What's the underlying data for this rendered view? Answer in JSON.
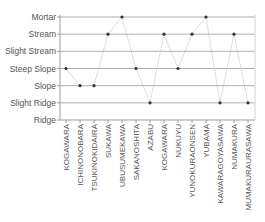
{
  "chart_data": {
    "type": "line",
    "title": "",
    "xlabel": "",
    "ylabel": "",
    "y_categories": [
      "Ridge",
      "Slight Ridge",
      "Slope",
      "Steep Slope",
      "Slight Stream",
      "Stream",
      "Mortar"
    ],
    "categories": [
      "KOGAWARA",
      "ICHINONOBARA",
      "TSUKINOKIDAIRA",
      "SUKAWA",
      "UBUSUMEKAWA",
      "SAKANOSHITA",
      "AZABU",
      "KOGAWARA",
      "NUKUYU",
      "YUNOKURAONSEN",
      "YUBAMA",
      "KAWARAGOYASAWA",
      "NUMAKURA",
      "MUMAKURAURASAWA"
    ],
    "series": [
      {
        "name": "landform",
        "values": [
          "Steep Slope",
          "Slope",
          "Slope",
          "Stream",
          "Mortar",
          "Steep Slope",
          "Slight Ridge",
          "Stream",
          "Steep Slope",
          "Stream",
          "Mortar",
          "Slight Ridge",
          "Stream",
          "Slight Ridge"
        ]
      }
    ],
    "grid": true,
    "legend": "none",
    "colors": {
      "grid": "#9a9a9a",
      "line": "#b8b8b8",
      "marker": "#333333",
      "axis": "#888888",
      "text": "#555555"
    }
  }
}
